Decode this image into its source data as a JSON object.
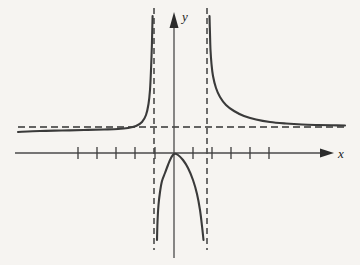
{
  "figure": {
    "background_color": "#f6f4f1",
    "curve_color": "#3a3a3a",
    "axis_color": "#4a4a4a",
    "asymptote_color": "#333333",
    "width": 360,
    "height": 265
  },
  "labels": {
    "x_axis": "x",
    "y_axis": "y"
  },
  "chart_data": {
    "type": "line",
    "title": "",
    "xlabel": "x",
    "ylabel": "y",
    "grid": false,
    "legend": null,
    "xlim": [
      -8.2,
      8.2
    ],
    "ylim": [
      -5.5,
      7.5
    ],
    "axes": {
      "origin_px": [
        174,
        153
      ],
      "x_unit_px": 19.2,
      "y_unit_px": 19.2,
      "x_axis_y_px": 153,
      "y_axis_x_px": 174,
      "x_axis_start_px": 15,
      "x_axis_end_px": 327,
      "y_axis_top_px": 16,
      "y_axis_bottom_px": 258
    },
    "x_ticks": [
      -5,
      -4,
      -3,
      -2,
      -1,
      1,
      2,
      3,
      4,
      5
    ],
    "x_tick_px": [
      78,
      97,
      116,
      135,
      155,
      193,
      212,
      231,
      250,
      269
    ],
    "y_ticks": [],
    "asymptotes": {
      "vertical": [
        {
          "x": -1.05,
          "x_px": 154,
          "style": "dashed",
          "y_top_px": 8,
          "y_bottom_px": 250
        },
        {
          "x": 1.7,
          "x_px": 207,
          "style": "dashed",
          "y_top_px": 8,
          "y_bottom_px": 250
        }
      ],
      "horizontal": [
        {
          "y": 1.35,
          "y_px": 127,
          "style": "dashed",
          "x_start_px": 18,
          "x_end_px": 345
        }
      ]
    },
    "branches": [
      {
        "name": "left-branch",
        "description": "Approaches horizontal asymptote from below as x decreases; rises to +infinity at the left vertical asymptote",
        "points_px": [
          [
            18,
            132
          ],
          [
            40,
            131
          ],
          [
            62,
            130.5
          ],
          [
            84,
            130
          ],
          [
            104,
            129.5
          ],
          [
            118,
            129
          ],
          [
            128,
            128
          ],
          [
            136,
            126
          ],
          [
            142,
            122
          ],
          [
            146,
            115
          ],
          [
            148.5,
            104
          ],
          [
            150,
            90
          ],
          [
            151,
            70
          ],
          [
            151.8,
            48
          ],
          [
            152.3,
            28
          ],
          [
            152.6,
            16
          ]
        ]
      },
      {
        "name": "middle-branch",
        "description": "Downward arch passing through the origin, falling to -infinity at both vertical asymptotes",
        "points_px": [
          [
            157,
            240
          ],
          [
            157.5,
            222
          ],
          [
            158.5,
            205
          ],
          [
            160,
            192
          ],
          [
            162,
            181
          ],
          [
            165,
            173
          ],
          [
            168,
            165
          ],
          [
            171,
            158
          ],
          [
            174,
            154
          ],
          [
            178,
            155
          ],
          [
            183,
            160
          ],
          [
            188,
            168
          ],
          [
            193,
            180
          ],
          [
            197,
            194
          ],
          [
            200,
            210
          ],
          [
            202,
            226
          ],
          [
            203.5,
            240
          ]
        ]
      },
      {
        "name": "right-branch",
        "description": "Descends from +infinity at the right vertical asymptote and approaches the horizontal asymptote from above",
        "points_px": [
          [
            209.5,
            16
          ],
          [
            210,
            34
          ],
          [
            210.5,
            50
          ],
          [
            211.5,
            64
          ],
          [
            213,
            76
          ],
          [
            216,
            88
          ],
          [
            220,
            97
          ],
          [
            226,
            105
          ],
          [
            234,
            111
          ],
          [
            244,
            116
          ],
          [
            256,
            119.5
          ],
          [
            270,
            122
          ],
          [
            286,
            123.5
          ],
          [
            302,
            124.5
          ],
          [
            318,
            125
          ],
          [
            332,
            125.3
          ],
          [
            345,
            125.5
          ]
        ]
      }
    ]
  }
}
